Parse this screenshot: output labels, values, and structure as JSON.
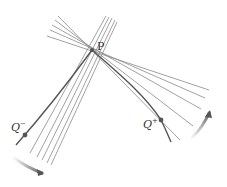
{
  "diagram": {
    "colors": {
      "background": "#ffffff",
      "curve": "#555555",
      "secant": "#8a8a8a",
      "point": "#555555",
      "arrow": "#666666",
      "label": "#333333"
    },
    "points": {
      "P": {
        "label": "P",
        "x": 92,
        "y": 50,
        "label_x": 97,
        "label_y": 50
      },
      "Q_minus": {
        "label": "Q",
        "sup": "−",
        "x": 25,
        "y": 135,
        "label_x": 11,
        "label_y": 131
      },
      "Q_plus": {
        "label": "Q",
        "sup": "+",
        "x": 161,
        "y": 120,
        "label_x": 143,
        "label_y": 128
      }
    },
    "curve_path": "M 16 145 C 40 118, 70 80, 92 50 C 115 70, 145 95, 161 120 C 165 128, 168 135, 171 142",
    "secants_left": [
      {
        "x1": 106,
        "y1": 16,
        "x2": 30,
        "y2": 153
      },
      {
        "x1": 109,
        "y1": 17,
        "x2": 37,
        "y2": 157
      },
      {
        "x1": 112,
        "y1": 18,
        "x2": 42,
        "y2": 160
      },
      {
        "x1": 115,
        "y1": 20,
        "x2": 47,
        "y2": 163
      },
      {
        "x1": 117,
        "y1": 22,
        "x2": 51,
        "y2": 165
      }
    ],
    "secants_right": [
      {
        "x1": 47,
        "y1": 36,
        "x2": 209,
        "y2": 90
      },
      {
        "x1": 50,
        "y1": 30,
        "x2": 205,
        "y2": 98
      },
      {
        "x1": 52,
        "y1": 25,
        "x2": 201,
        "y2": 109
      },
      {
        "x1": 55,
        "y1": 20,
        "x2": 193,
        "y2": 126
      },
      {
        "x1": 58,
        "y1": 16,
        "x2": 180,
        "y2": 140
      }
    ],
    "arrows": [
      {
        "name": "arrow-q-minus",
        "path": "M 14 158 Q 28 168, 42 173",
        "direction": "toward P (clockwise)"
      },
      {
        "name": "arrow-q-plus",
        "path": "M 192 138 Q 203 127, 209 113",
        "direction": "toward P (counter-clockwise)"
      }
    ]
  }
}
